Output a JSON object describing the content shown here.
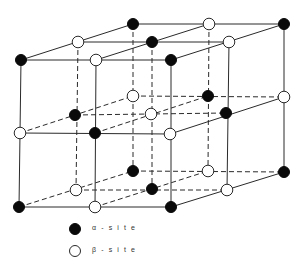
{
  "diagram": {
    "colors": {
      "alpha_fill": "#0a0a0a",
      "beta_fill": "#ffffff",
      "line": "#2a2a2a"
    }
  },
  "legend": {
    "items": [
      {
        "symbol": "filled-circle",
        "label": "α - s i t e"
      },
      {
        "symbol": "open-circle",
        "label": "β - s i t e"
      }
    ]
  },
  "nodes": [
    {
      "id": "f-tl",
      "x": 21,
      "y": 60,
      "type": "alpha"
    },
    {
      "id": "f-tm",
      "x": 96,
      "y": 60,
      "type": "beta"
    },
    {
      "id": "f-tr",
      "x": 171,
      "y": 60,
      "type": "alpha"
    },
    {
      "id": "f-ml",
      "x": 20,
      "y": 133,
      "type": "beta"
    },
    {
      "id": "f-mm",
      "x": 95,
      "y": 133,
      "type": "alpha"
    },
    {
      "id": "f-mr",
      "x": 170,
      "y": 134,
      "type": "beta"
    },
    {
      "id": "f-bl",
      "x": 19,
      "y": 207,
      "type": "alpha"
    },
    {
      "id": "f-bm",
      "x": 95,
      "y": 207,
      "type": "beta"
    },
    {
      "id": "f-br",
      "x": 171,
      "y": 207,
      "type": "alpha"
    },
    {
      "id": "m-tl",
      "x": 78,
      "y": 42,
      "type": "beta"
    },
    {
      "id": "m-tm",
      "x": 152,
      "y": 42,
      "type": "alpha"
    },
    {
      "id": "m-tr",
      "x": 229,
      "y": 42,
      "type": "beta"
    },
    {
      "id": "m-ml",
      "x": 75,
      "y": 115,
      "type": "alpha"
    },
    {
      "id": "m-mm",
      "x": 151,
      "y": 114,
      "type": "beta"
    },
    {
      "id": "m-mr",
      "x": 226,
      "y": 113,
      "type": "alpha"
    },
    {
      "id": "m-bl",
      "x": 76,
      "y": 190,
      "type": "beta"
    },
    {
      "id": "m-bm",
      "x": 152,
      "y": 189,
      "type": "alpha"
    },
    {
      "id": "m-br",
      "x": 227,
      "y": 190,
      "type": "beta"
    },
    {
      "id": "b-tl",
      "x": 133,
      "y": 24,
      "type": "alpha"
    },
    {
      "id": "b-tm",
      "x": 209,
      "y": 24,
      "type": "beta"
    },
    {
      "id": "b-tr",
      "x": 284,
      "y": 24,
      "type": "alpha"
    },
    {
      "id": "b-ml",
      "x": 133,
      "y": 96,
      "type": "beta"
    },
    {
      "id": "b-mm",
      "x": 208,
      "y": 96,
      "type": "alpha"
    },
    {
      "id": "b-mr",
      "x": 284,
      "y": 97,
      "type": "beta"
    },
    {
      "id": "b-bl",
      "x": 133,
      "y": 171,
      "type": "alpha"
    },
    {
      "id": "b-bm",
      "x": 208,
      "y": 171,
      "type": "beta"
    },
    {
      "id": "b-br",
      "x": 284,
      "y": 172,
      "type": "alpha"
    }
  ]
}
